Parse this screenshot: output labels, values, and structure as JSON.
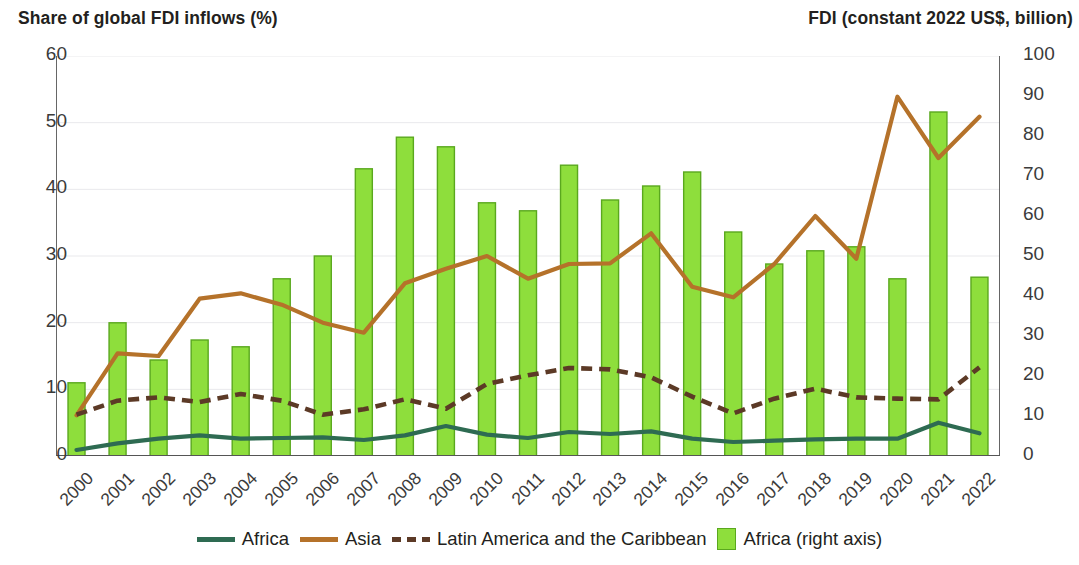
{
  "header": {
    "left_title": "Share of global FDI inflows (%)",
    "right_title": "FDI (constant 2022 US$, billion)"
  },
  "legend": [
    {
      "label": "Africa",
      "type": "line",
      "color": "#2e6b52"
    },
    {
      "label": "Asia",
      "type": "line",
      "color": "#b5722a"
    },
    {
      "label": "Latin America and the Caribbean",
      "type": "dashed-line",
      "color": "#5c3a26"
    },
    {
      "label": "Africa (right axis)",
      "type": "bar",
      "color": "#8ede3c"
    }
  ],
  "chart_data": {
    "type": "bar",
    "title": "Share of global FDI inflows (%)",
    "subtitle": "FDI (constant 2022 US$, billion)",
    "xlabel": "",
    "ylabel": "Share of global FDI inflows (%)",
    "y2label": "FDI (constant 2022 US$, billion)",
    "ylim": [
      0,
      60
    ],
    "y2lim": [
      0,
      100
    ],
    "yticks": [
      0,
      10,
      20,
      30,
      40,
      50,
      60
    ],
    "y2ticks": [
      0,
      10,
      20,
      30,
      40,
      50,
      60,
      70,
      80,
      90,
      100
    ],
    "grid": true,
    "legend_position": "bottom",
    "categories": [
      "2000",
      "2001",
      "2002",
      "2003",
      "2004",
      "2005",
      "2006",
      "2007",
      "2008",
      "2009",
      "2010",
      "2011",
      "2012",
      "2013",
      "2014",
      "2015",
      "2016",
      "2017",
      "2018",
      "2019",
      "2020",
      "2021",
      "2022"
    ],
    "series": [
      {
        "name": "Africa (right axis)",
        "type": "bar",
        "axis": "right",
        "color": "#8ede3c",
        "edge_color": "#5aa81e",
        "values": [
          18.3,
          33.3,
          24.0,
          29.0,
          27.3,
          44.3,
          50.0,
          71.8,
          79.7,
          77.3,
          63.3,
          61.3,
          72.7,
          64.0,
          67.5,
          71.0,
          56.0,
          48.0,
          51.3,
          52.3,
          44.3,
          86.0,
          44.7
        ]
      },
      {
        "name": "Africa",
        "type": "line",
        "axis": "left",
        "color": "#2e6b52",
        "values": [
          0.9,
          1.9,
          2.6,
          3.1,
          2.6,
          2.7,
          2.8,
          2.4,
          3.1,
          4.5,
          3.2,
          2.7,
          3.6,
          3.3,
          3.7,
          2.6,
          2.1,
          2.3,
          2.5,
          2.6,
          2.6,
          5.0,
          3.4
        ]
      },
      {
        "name": "Asia",
        "type": "line",
        "axis": "left",
        "color": "#b5722a",
        "values": [
          6.1,
          15.4,
          15.0,
          23.6,
          24.4,
          22.7,
          20.0,
          18.5,
          25.9,
          28.1,
          30.0,
          26.6,
          28.8,
          28.9,
          33.4,
          25.4,
          23.8,
          28.8,
          36.0,
          29.6,
          53.9,
          44.7,
          50.9
        ]
      },
      {
        "name": "Latin America and the Caribbean",
        "type": "dashed-line",
        "axis": "left",
        "color": "#5c3a26",
        "values": [
          6.2,
          8.3,
          8.8,
          8.1,
          9.3,
          8.3,
          6.2,
          7.0,
          8.5,
          7.1,
          10.8,
          12.1,
          13.2,
          13.0,
          11.8,
          8.9,
          6.4,
          8.6,
          10.1,
          8.8,
          8.6,
          8.5,
          13.3
        ]
      }
    ]
  }
}
